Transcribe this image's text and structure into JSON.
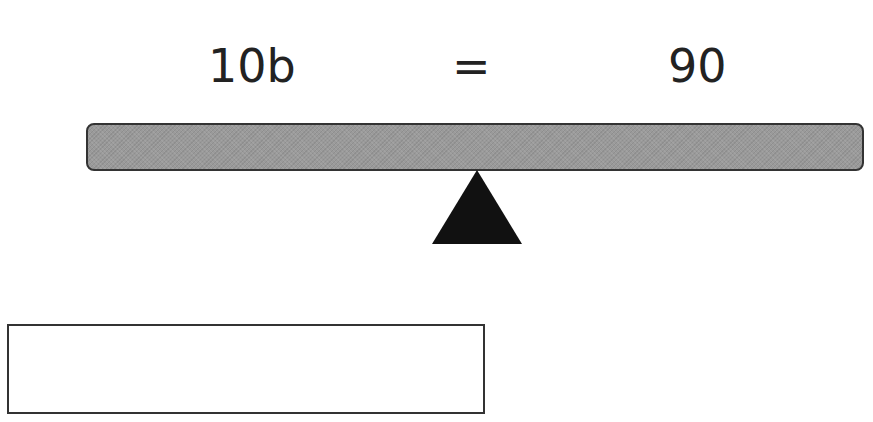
{
  "equation": {
    "left": "10b",
    "operator": "=",
    "right": "90"
  },
  "balance": {
    "beam_color": "#9a9a9a",
    "fulcrum_color": "#111111"
  },
  "answer": {
    "value": "",
    "placeholder": ""
  }
}
